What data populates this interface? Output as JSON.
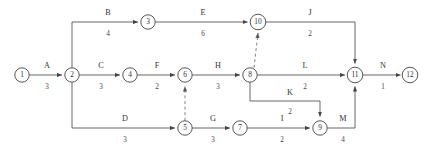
{
  "diagram": {
    "width": 427,
    "height": 156,
    "background_color": "#ffffff",
    "line_color": "#555555",
    "node_stroke_color": "#444444",
    "text_color": "#333333"
  },
  "nodes": [
    {
      "id": "1",
      "label": "1",
      "cx": 22,
      "cy": 75,
      "r": 7.2
    },
    {
      "id": "2",
      "label": "2",
      "cx": 72,
      "cy": 75,
      "r": 7.2
    },
    {
      "id": "3",
      "label": "3",
      "cx": 148,
      "cy": 22,
      "r": 7.2
    },
    {
      "id": "4",
      "label": "4",
      "cx": 130,
      "cy": 75,
      "r": 7.2
    },
    {
      "id": "5",
      "label": "5",
      "cx": 185,
      "cy": 128,
      "r": 7.2
    },
    {
      "id": "6",
      "label": "6",
      "cx": 185,
      "cy": 75,
      "r": 7.2
    },
    {
      "id": "7",
      "label": "7",
      "cx": 240,
      "cy": 128,
      "r": 7.2
    },
    {
      "id": "8",
      "label": "8",
      "cx": 250,
      "cy": 75,
      "r": 7.2
    },
    {
      "id": "9",
      "label": "9",
      "cx": 320,
      "cy": 128,
      "r": 7.2
    },
    {
      "id": "10",
      "label": "10",
      "cx": 258,
      "cy": 22,
      "r": 7.8
    },
    {
      "id": "11",
      "label": "11",
      "cx": 355,
      "cy": 75,
      "r": 7.8
    },
    {
      "id": "12",
      "label": "12",
      "cx": 410,
      "cy": 75,
      "r": 7.8
    }
  ],
  "activities": [
    {
      "name": "A",
      "duration": "3",
      "from": "1",
      "to": "2",
      "name_x": 47,
      "name_y": 68,
      "dur_x": 47,
      "dur_y": 87
    },
    {
      "name": "B",
      "duration": "4",
      "from": "2",
      "to": "3",
      "name_x": 108,
      "name_y": 15,
      "dur_x": 108,
      "dur_y": 34
    },
    {
      "name": "C",
      "duration": "3",
      "from": "2",
      "to": "4",
      "name_x": 101,
      "name_y": 68,
      "dur_x": 101,
      "dur_y": 87
    },
    {
      "name": "D",
      "duration": "3",
      "from": "2",
      "to": "5",
      "name_x": 125,
      "name_y": 121,
      "dur_x": 125,
      "dur_y": 140
    },
    {
      "name": "E",
      "duration": "6",
      "from": "3",
      "to": "10",
      "name_x": 203,
      "name_y": 15,
      "dur_x": 203,
      "dur_y": 34
    },
    {
      "name": "F",
      "duration": "2",
      "from": "4",
      "to": "6",
      "name_x": 157,
      "name_y": 68,
      "dur_x": 157,
      "dur_y": 87
    },
    {
      "name": "G",
      "duration": "3",
      "from": "5",
      "to": "7",
      "name_x": 213,
      "name_y": 121,
      "dur_x": 213,
      "dur_y": 140
    },
    {
      "name": "H",
      "duration": "3",
      "from": "6",
      "to": "8",
      "name_x": 218,
      "name_y": 68,
      "dur_x": 218,
      "dur_y": 87
    },
    {
      "name": "I",
      "duration": "2",
      "from": "7",
      "to": "9",
      "name_x": 282,
      "name_y": 121,
      "dur_x": 282,
      "dur_y": 140
    },
    {
      "name": "J",
      "duration": "2",
      "from": "10",
      "to": "11",
      "name_x": 310,
      "name_y": 15,
      "dur_x": 310,
      "dur_y": 34
    },
    {
      "name": "K",
      "duration": "2",
      "from": "8",
      "to": "9",
      "name_x": 290,
      "name_y": 95,
      "dur_x": 290,
      "dur_y": 112
    },
    {
      "name": "L",
      "duration": "2",
      "from": "8",
      "to": "11",
      "name_x": 305,
      "name_y": 68,
      "dur_x": 305,
      "dur_y": 87
    },
    {
      "name": "M",
      "duration": "4",
      "from": "9",
      "to": "11",
      "name_x": 343,
      "name_y": 121,
      "dur_x": 343,
      "dur_y": 140
    },
    {
      "name": "N",
      "duration": "1",
      "from": "11",
      "to": "12",
      "name_x": 383,
      "name_y": 68,
      "dur_x": 383,
      "dur_y": 87
    }
  ],
  "dummy_activities": [
    {
      "id": "dummy-5-6",
      "from": "5",
      "to": "6"
    },
    {
      "id": "dummy-8-10",
      "from": "8",
      "to": "10"
    }
  ]
}
